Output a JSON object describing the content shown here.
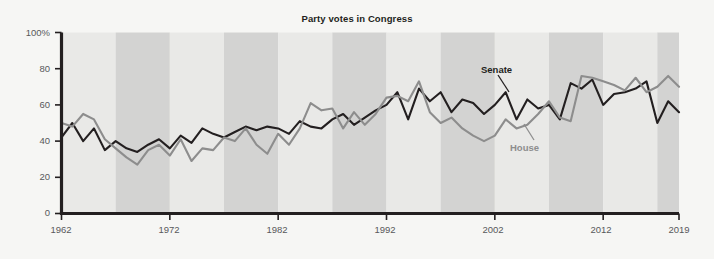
{
  "chart_data": {
    "type": "line",
    "title": "Party votes in Congress",
    "xlabel": "",
    "ylabel": "",
    "xlim": [
      1962,
      2019
    ],
    "ylim": [
      0,
      100
    ],
    "grid": false,
    "legend_position": "inline-annotations",
    "x_tick_labels": [
      "1962",
      "1972",
      "1982",
      "1992",
      "2002",
      "2012",
      "2019"
    ],
    "x_ticks": [
      1962,
      1972,
      1982,
      1992,
      2002,
      2012,
      2019
    ],
    "y_tick_labels": [
      "0",
      "20",
      "40",
      "60",
      "80",
      "100%"
    ],
    "y_ticks": [
      0,
      20,
      40,
      60,
      80,
      100
    ],
    "background_bands": {
      "note": "alternating light and darker vertical gray bands, each band spans about 5 years",
      "light_color": "#e9e9e7",
      "dark_color": "#d3d3d2",
      "band_years": 5
    },
    "x": [
      1962,
      1963,
      1964,
      1965,
      1966,
      1967,
      1968,
      1969,
      1970,
      1971,
      1972,
      1973,
      1974,
      1975,
      1976,
      1977,
      1978,
      1979,
      1980,
      1981,
      1982,
      1983,
      1984,
      1985,
      1986,
      1987,
      1988,
      1989,
      1990,
      1991,
      1992,
      1993,
      1994,
      1995,
      1996,
      1997,
      1998,
      1999,
      2000,
      2001,
      2002,
      2003,
      2004,
      2005,
      2006,
      2007,
      2008,
      2009,
      2010,
      2011,
      2012,
      2013,
      2014,
      2015,
      2016,
      2017,
      2018,
      2019
    ],
    "series": [
      {
        "name": "Senate",
        "color": "#231f20",
        "values": [
          42,
          50,
          40,
          47,
          35,
          40,
          36,
          34,
          38,
          41,
          36,
          43,
          39,
          47,
          44,
          42,
          45,
          48,
          46,
          48,
          47,
          44,
          51,
          48,
          47,
          52,
          55,
          49,
          53,
          57,
          60,
          67,
          52,
          69,
          62,
          67,
          56,
          63,
          61,
          55,
          60,
          67,
          52,
          63,
          58,
          60,
          52,
          72,
          69,
          74,
          60,
          66,
          67,
          69,
          73,
          50,
          62,
          56
        ],
        "label_annotation": "Senate"
      },
      {
        "name": "House",
        "color": "#8d8d8d",
        "values": [
          50,
          48,
          55,
          52,
          41,
          36,
          31,
          27,
          35,
          38,
          32,
          41,
          29,
          36,
          35,
          42,
          40,
          47,
          38,
          33,
          44,
          38,
          47,
          61,
          57,
          58,
          47,
          56,
          49,
          55,
          64,
          65,
          62,
          73,
          56,
          50,
          53,
          47,
          43,
          40,
          43,
          52,
          47,
          49,
          55,
          62,
          53,
          51,
          76,
          75,
          73,
          71,
          68,
          75,
          67,
          70,
          76,
          70
        ],
        "label_annotation": "House"
      }
    ]
  },
  "axis": {
    "y_labels": [
      "100%",
      "80",
      "60",
      "40",
      "20",
      "0"
    ],
    "x_labels": [
      "1962",
      "1972",
      "1982",
      "1992",
      "2002",
      "2012",
      "2019"
    ]
  },
  "annotations": {
    "senate": "Senate",
    "house": "House"
  },
  "colors": {
    "senate_line": "#231f20",
    "house_line": "#8d8d8d",
    "axis": "#231f20",
    "tick_text": "#58595b",
    "page_background": "#f6f6f4",
    "band_light": "#e9e9e7",
    "band_dark": "#d3d3d2"
  }
}
